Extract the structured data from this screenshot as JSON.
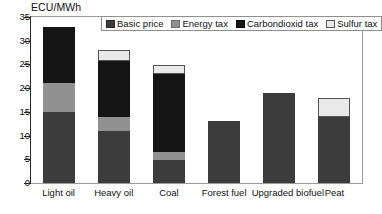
{
  "chart_data": {
    "type": "bar",
    "title": "ECU/MWh",
    "xlabel": "",
    "ylabel": "ECU/MWh",
    "ylim": [
      0,
      35
    ],
    "yticks": [
      0,
      5,
      10,
      15,
      20,
      25,
      30,
      35
    ],
    "grid": false,
    "stacked": true,
    "legend_position": "top-center-inside",
    "categories": [
      "Light oil",
      "Heavy oil",
      "Coal",
      "Forest fuel",
      "Upgraded biofuel",
      "Peat"
    ],
    "series": [
      {
        "name": "Basic price",
        "color": "#3c3c3c",
        "values": [
          15,
          11,
          4.8,
          13,
          19,
          14
        ]
      },
      {
        "name": "Energy tax",
        "color": "#919191",
        "values": [
          6,
          3,
          1.8,
          0,
          0,
          0
        ]
      },
      {
        "name": "Carbondioxid tax",
        "color": "#151515",
        "values": [
          12,
          11.8,
          16.4,
          0,
          0,
          0
        ]
      },
      {
        "name": "Sulfur tax",
        "color": "#e9e9e9",
        "values": [
          0,
          2.2,
          1.8,
          0,
          0,
          4
        ]
      }
    ],
    "totals": [
      33,
      28,
      24.8,
      13,
      19,
      18
    ]
  },
  "legend": {
    "entries": [
      {
        "label": "Basic price"
      },
      {
        "label": "Energy tax"
      },
      {
        "label": "Carbondioxid tax"
      },
      {
        "label": "Sulfur tax"
      }
    ]
  },
  "axes": {
    "y_tick_labels": [
      "0",
      "5",
      "10",
      "15",
      "20",
      "25",
      "30",
      "35"
    ],
    "x_tick_labels": [
      "Light oil",
      "Heavy oil",
      "Coal",
      "Forest fuel",
      "Upgraded biofuel",
      "Peat"
    ]
  }
}
